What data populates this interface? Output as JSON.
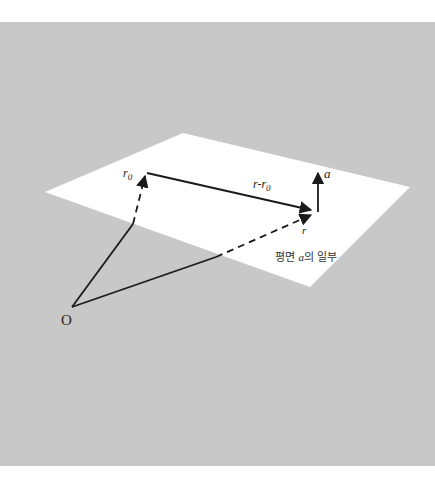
{
  "diagram": {
    "type": "vector-plane-diagram",
    "colors": {
      "page_background": "#ffffff",
      "panel_background": "#c8c8c8",
      "plane_fill": "#ffffff",
      "stroke": "#1a1a1a"
    },
    "panel": {
      "x": 0,
      "y": 22,
      "width": 435,
      "height": 444
    },
    "plane": {
      "corners": [
        [
          45,
          192
        ],
        [
          183,
          133
        ],
        [
          410,
          187
        ],
        [
          310,
          287
        ]
      ],
      "caption_prefix": "평면 ",
      "caption_symbol": "a",
      "caption_suffix": "의 일부"
    },
    "points": {
      "origin": {
        "x": 72,
        "y": 307,
        "label": "O"
      },
      "r0": {
        "x": 146,
        "y": 174,
        "label": "r",
        "subscript": "0"
      },
      "r": {
        "x": 313,
        "y": 212,
        "label": "r"
      }
    },
    "vectors": [
      {
        "name": "O-to-r0",
        "from": "origin",
        "to": "r0",
        "style": "solid-then-dashed",
        "label": ""
      },
      {
        "name": "O-to-r",
        "from": "origin",
        "to": "r",
        "style": "solid-then-dashed",
        "label": ""
      },
      {
        "name": "r-minus-r0",
        "from": "r0",
        "to": "r",
        "style": "solid",
        "label": "r-r",
        "label_subscript": "0"
      },
      {
        "name": "normal-a",
        "from": [
          318,
          212
        ],
        "to": [
          318,
          172
        ],
        "style": "solid",
        "label": "a"
      }
    ]
  },
  "labels": {
    "origin": "O",
    "r0_main": "r",
    "r0_sub": "0",
    "r": "r",
    "diff_main": "r-r",
    "diff_sub": "0",
    "normal": "a",
    "plane_caption_prefix": "평면 ",
    "plane_caption_symbol": "a",
    "plane_caption_suffix": "의 일부"
  }
}
